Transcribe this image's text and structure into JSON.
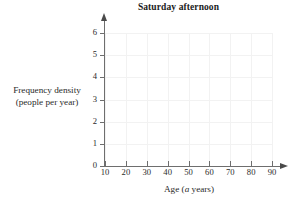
{
  "chart_data": {
    "type": "bar",
    "title": "Saturday afternoon",
    "xlabel_parts": {
      "before": "Age (",
      "italic": "a",
      "after": " years)"
    },
    "xlabel": "Age (a years)",
    "ylabel_line1": "Frequency density",
    "ylabel_line2": "(people per year)",
    "ylabel": "Frequency density (people per year)",
    "categories": [],
    "values": [],
    "series": [],
    "xticks": [
      10,
      20,
      30,
      40,
      50,
      60,
      70,
      80,
      90
    ],
    "yticks": [
      0,
      1,
      2,
      3,
      4,
      5,
      6
    ],
    "xlim": [
      10,
      90
    ],
    "ylim": [
      0,
      6
    ],
    "grid": true,
    "legend": "none",
    "note": "empty axes - no bars plotted"
  },
  "style": {
    "axis_color": "#6e6e6e",
    "grid_color": "#f2f2f2",
    "text_color": "#2a2a2a",
    "title_color": "#1b1b1b",
    "background": "#ffffff"
  }
}
